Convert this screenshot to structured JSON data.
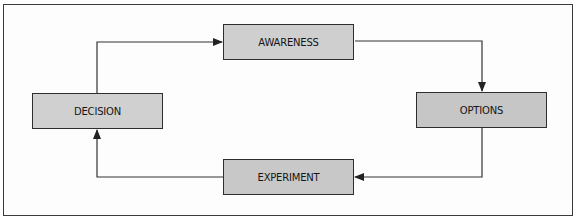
{
  "diagram": {
    "type": "cycle-flow",
    "colors": {
      "node_fill": "#c9c9c9",
      "line": "#333333",
      "background": "#ffffff"
    },
    "nodes": [
      {
        "id": "awareness",
        "label": "AWARENESS"
      },
      {
        "id": "options",
        "label": "OPTIONS"
      },
      {
        "id": "experiment",
        "label": "EXPERIMENT"
      },
      {
        "id": "decision",
        "label": "DECISION"
      }
    ],
    "edges": [
      {
        "from": "awareness",
        "to": "options"
      },
      {
        "from": "options",
        "to": "experiment"
      },
      {
        "from": "experiment",
        "to": "decision"
      },
      {
        "from": "decision",
        "to": "awareness"
      }
    ]
  }
}
